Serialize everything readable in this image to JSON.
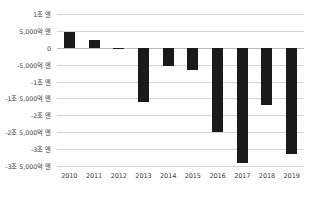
{
  "chart_data": {
    "type": "bar",
    "title": "",
    "xlabel": "",
    "ylabel": "",
    "categories": [
      "2010",
      "2011",
      "2012",
      "2013",
      "2014",
      "2015",
      "2016",
      "2017",
      "2018",
      "2019"
    ],
    "values": [
      4800,
      2400,
      -200,
      -16000,
      -5500,
      -6500,
      -25000,
      -34000,
      -17000,
      -31500
    ],
    "unit": "억 엔",
    "ylim": [
      -35000,
      10000
    ],
    "ytick_values": [
      10000,
      5000,
      0,
      -5000,
      -10000,
      -15000,
      -20000,
      -25000,
      -30000,
      -35000
    ],
    "ytick_labels": [
      "1조 엔",
      "5,000억 엔",
      "0",
      "-5,000억 엔",
      "-1조 엔",
      "-1조 5,000억 엔",
      "-2조 엔",
      "-2조 5,000억 엔",
      "-3조 엔",
      "-3조 5,000억 엔"
    ],
    "grid": true,
    "legend": "none",
    "bar_color": "#1a1a1a",
    "gridline_color": "#d4d4d4"
  }
}
